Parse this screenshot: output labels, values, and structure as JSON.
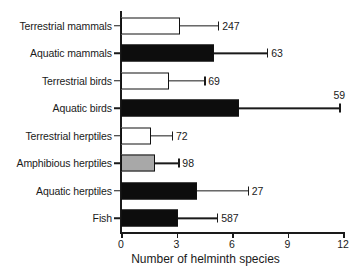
{
  "chart_data": {
    "type": "bar",
    "orientation": "horizontal",
    "title": "",
    "xlabel": "Number of helminth species",
    "ylabel": "",
    "xlim": [
      0,
      12
    ],
    "xticks": [
      0,
      3,
      6,
      9,
      12
    ],
    "grid": false,
    "legend": null,
    "categories": [
      "Terrestrial mammals",
      "Aquatic mammals",
      "Terrestrial birds",
      "Aquatic birds",
      "Terrestrial herptiles",
      "Amphibious herptiles",
      "Aquatic herptiles",
      "Fish"
    ],
    "values": [
      3.2,
      5.0,
      2.6,
      6.4,
      1.6,
      1.85,
      4.1,
      3.1
    ],
    "error_upper": [
      5.25,
      7.9,
      4.5,
      11.8,
      2.75,
      3.1,
      6.85,
      5.2
    ],
    "sample_sizes": [
      "247",
      "63",
      "69",
      "59",
      "72",
      "98",
      "27",
      "587"
    ],
    "bar_fills": [
      "white",
      "black",
      "white",
      "black",
      "white",
      "gray",
      "black",
      "black"
    ],
    "label_placement": [
      "right",
      "right",
      "right",
      "above",
      "right",
      "right",
      "right",
      "right"
    ],
    "colors": {
      "white": "#ffffff",
      "black": "#0d0d0d",
      "gray": "#a8a8a8",
      "axis": "#1a1a1a",
      "text": "#1a1a1a",
      "background": "#ffffff"
    }
  }
}
